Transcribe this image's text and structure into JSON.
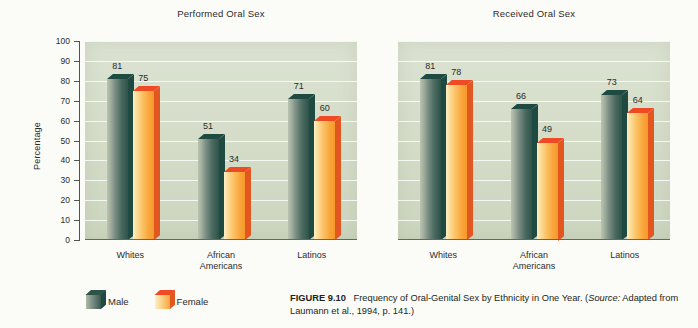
{
  "figure": {
    "label": "FIGURE 9.10",
    "caption_main": "Frequency of Oral-Genital Sex by Ethnicity in One Year.",
    "source_prefix": "(",
    "source_italic": "Source:",
    "source_text": " Adapted from Laumann et al., 1994, p. 141.)"
  },
  "legend": {
    "male_label": "Male",
    "female_label": "Female",
    "male_color": "#2e5349",
    "female_color": "#f9a63c"
  },
  "chart_data": [
    {
      "type": "bar",
      "title": "Performed Oral Sex",
      "categories": [
        "Whites",
        "African\nAmericans",
        "Latinos"
      ],
      "series": [
        {
          "name": "Male",
          "values": [
            81,
            51,
            71
          ],
          "color": "#2e5349"
        },
        {
          "name": "Female",
          "values": [
            75,
            34,
            60
          ],
          "color": "#f9a63c"
        }
      ],
      "xlabel": "",
      "ylabel": "Percentage",
      "ylim": [
        0,
        100
      ],
      "yticks": [
        0,
        10,
        20,
        30,
        40,
        50,
        60,
        70,
        80,
        90,
        100
      ],
      "grid": true,
      "legend_position": "bottom-left"
    },
    {
      "type": "bar",
      "title": "Received Oral Sex",
      "categories": [
        "Whites",
        "African\nAmericans",
        "Latinos"
      ],
      "series": [
        {
          "name": "Male",
          "values": [
            81,
            66,
            73
          ],
          "color": "#2e5349"
        },
        {
          "name": "Female",
          "values": [
            78,
            49,
            64
          ],
          "color": "#f9a63c"
        }
      ],
      "xlabel": "",
      "ylabel": "",
      "ylim": [
        0,
        100
      ],
      "yticks": [
        0,
        10,
        20,
        30,
        40,
        50,
        60,
        70,
        80,
        90,
        100
      ],
      "grid": true,
      "legend_position": "bottom-left"
    }
  ]
}
